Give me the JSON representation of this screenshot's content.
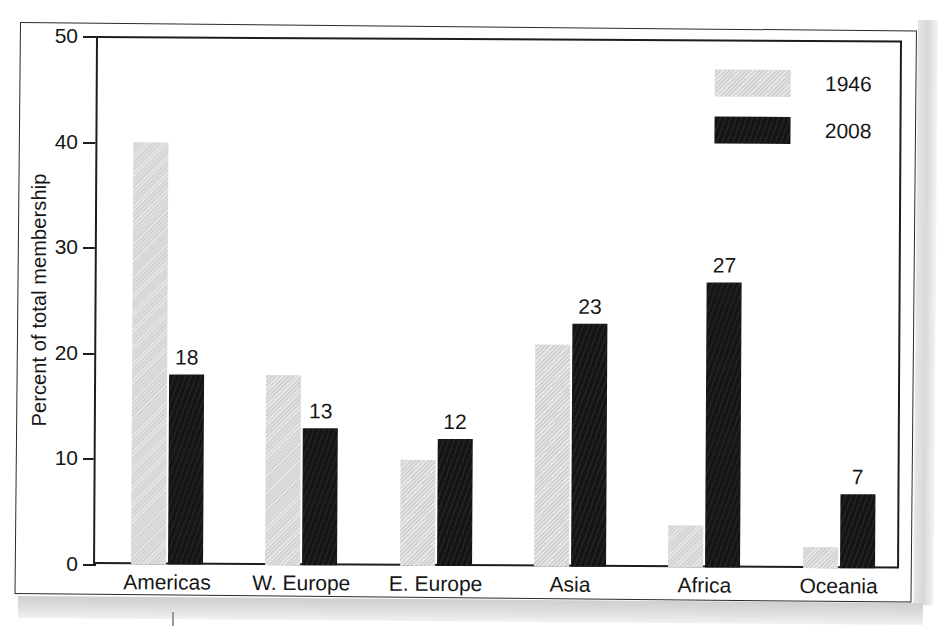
{
  "figure": {
    "y_axis_title": "Percent of total membership",
    "y_ticks": [
      "0",
      "10",
      "20",
      "30",
      "40",
      "50"
    ]
  },
  "legend": {
    "position": "top-right",
    "entries": [
      {
        "label": "1946",
        "swatch": "light-gray-hatched",
        "color": "#d3d3d3"
      },
      {
        "label": "2008",
        "swatch": "black",
        "color": "#141414"
      }
    ]
  },
  "chart_data": {
    "type": "bar",
    "title": "",
    "subtitle": "",
    "xlabel": "",
    "ylabel": "Percent of total membership",
    "ylim": [
      0,
      50
    ],
    "yticks": [
      0,
      10,
      20,
      30,
      40,
      50
    ],
    "grid": false,
    "legend_position": "top-right",
    "categories": [
      "Americas",
      "W. Europe",
      "E. Europe",
      "Asia",
      "Africa",
      "Oceania"
    ],
    "series": [
      {
        "name": "1946",
        "color": "#d3d3d3",
        "values": [
          40,
          18,
          10,
          21,
          4,
          2
        ],
        "data_labels": [
          "",
          "",
          "",
          "",
          "",
          ""
        ]
      },
      {
        "name": "2008",
        "color": "#141414",
        "values": [
          18,
          13,
          12,
          23,
          27,
          7
        ],
        "data_labels": [
          "18",
          "13",
          "12",
          "23",
          "27",
          "7"
        ]
      }
    ],
    "annotations": []
  }
}
